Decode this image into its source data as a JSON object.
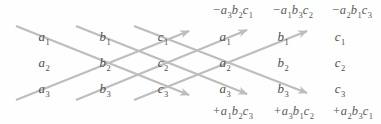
{
  "colors": {
    "background": "#fefefe",
    "arrow": "#bdbdbd",
    "entry_text": "#4f4f4f",
    "product_text": "#5a5a5a"
  },
  "matrix": {
    "left": [
      [
        {
          "v": "a",
          "s": "1"
        },
        {
          "v": "b",
          "s": "1"
        },
        {
          "v": "c",
          "s": "1"
        }
      ],
      [
        {
          "v": "a",
          "s": "2"
        },
        {
          "v": "b",
          "s": "2"
        },
        {
          "v": "c",
          "s": "2"
        }
      ],
      [
        {
          "v": "a",
          "s": "3"
        },
        {
          "v": "b",
          "s": "3"
        },
        {
          "v": "c",
          "s": "3"
        }
      ]
    ],
    "right": [
      [
        {
          "v": "a",
          "s": "1"
        },
        {
          "v": "b",
          "s": "1"
        },
        {
          "v": "c",
          "s": "1"
        }
      ],
      [
        {
          "v": "a",
          "s": "2"
        },
        {
          "v": "b",
          "s": "2"
        },
        {
          "v": "c",
          "s": "2"
        }
      ],
      [
        {
          "v": "a",
          "s": "3"
        },
        {
          "v": "b",
          "s": "3"
        },
        {
          "v": "c",
          "s": "3"
        }
      ]
    ]
  },
  "products": {
    "top": [
      {
        "sign": "−",
        "f": [
          {
            "v": "a",
            "s": "3"
          },
          {
            "v": "b",
            "s": "2"
          },
          {
            "v": "c",
            "s": "1"
          }
        ]
      },
      {
        "sign": "−",
        "f": [
          {
            "v": "a",
            "s": "1"
          },
          {
            "v": "b",
            "s": "3"
          },
          {
            "v": "c",
            "s": "2"
          }
        ]
      },
      {
        "sign": "−",
        "f": [
          {
            "v": "a",
            "s": "2"
          },
          {
            "v": "b",
            "s": "1"
          },
          {
            "v": "c",
            "s": "3"
          }
        ]
      }
    ],
    "bottom": [
      {
        "sign": "+",
        "f": [
          {
            "v": "a",
            "s": "1"
          },
          {
            "v": "b",
            "s": "2"
          },
          {
            "v": "c",
            "s": "3"
          }
        ]
      },
      {
        "sign": "+",
        "f": [
          {
            "v": "a",
            "s": "3"
          },
          {
            "v": "b",
            "s": "1"
          },
          {
            "v": "c",
            "s": "2"
          }
        ]
      },
      {
        "sign": "+",
        "f": [
          {
            "v": "a",
            "s": "2"
          },
          {
            "v": "b",
            "s": "3"
          },
          {
            "v": "c",
            "s": "1"
          }
        ]
      }
    ]
  }
}
